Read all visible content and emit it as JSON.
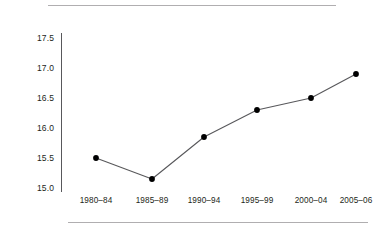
{
  "figure": {
    "top_rule": "",
    "bottom_rule": ""
  },
  "axes": {
    "y_ticks": [
      "17.5",
      "17.0",
      "16.5",
      "16.0",
      "15.5",
      "15.0"
    ],
    "x_ticks": [
      "1980–84",
      "1985–89",
      "1990–94",
      "1995–99",
      "2000–04",
      "2005–06"
    ]
  },
  "style": {
    "line_color": "#58585b",
    "marker_color": "#000000",
    "axis_color": "#58585b",
    "rule_color": "#b0aeb0",
    "text_color": "#231f20"
  },
  "chart_data": {
    "type": "line",
    "title": "",
    "subtitle": "",
    "xlabel": "",
    "ylabel": "",
    "categories": [
      "1980–84",
      "1985–89",
      "1990–94",
      "1995–99",
      "2000–04",
      "2005–06"
    ],
    "values": [
      15.5,
      15.15,
      15.85,
      16.3,
      16.5,
      16.9
    ],
    "series": [
      {
        "name": "",
        "values": [
          15.5,
          15.15,
          15.85,
          16.3,
          16.5,
          16.9
        ]
      }
    ],
    "ylim": [
      15.0,
      17.5
    ],
    "ytick_values": [
      17.5,
      17.0,
      16.5,
      16.0,
      15.5,
      15.0
    ],
    "grid": false,
    "legend": "none",
    "markers": "filled-circle",
    "annotations": []
  }
}
